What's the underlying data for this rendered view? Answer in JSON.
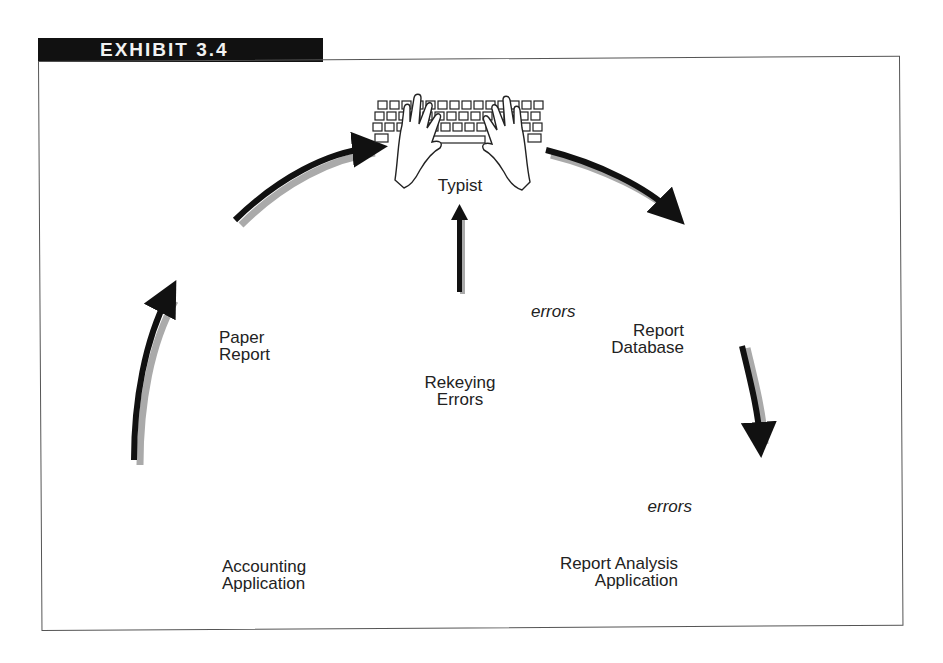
{
  "exhibit": {
    "title": "EXHIBIT 3.4"
  },
  "nodes": {
    "typist": {
      "label": "Typist",
      "icon": "hands-on-keyboard"
    },
    "paper_report": {
      "label_line1": "Paper",
      "label_line2": "Report",
      "icon": "document"
    },
    "report_database": {
      "label_line1": "Report",
      "label_line2": "Database",
      "icon": "server-with-database"
    },
    "rekeying_errors": {
      "label_line1": "Rekeying",
      "label_line2": "Errors",
      "annotation": "errors",
      "icon": "keyboard-crossed-out"
    },
    "accounting_application": {
      "label_line1": "Accounting",
      "label_line2": "Application",
      "icon": "server-with-database"
    },
    "report_analysis_application": {
      "label_line1": "Report Analysis",
      "label_line2": "Application",
      "annotation": "errors",
      "icon": "desktop-computer-with-errors"
    }
  },
  "flow": [
    {
      "from": "Accounting Application",
      "to": "Paper Report"
    },
    {
      "from": "Paper Report",
      "to": "Typist"
    },
    {
      "from": "Rekeying Errors",
      "to": "Typist"
    },
    {
      "from": "Typist",
      "to": "Report Database"
    },
    {
      "from": "Report Database",
      "to": "Report Analysis Application"
    }
  ],
  "colors": {
    "ink": "#111111",
    "shadow": "#9a9a9a",
    "fill": "#cfcfcf",
    "paper": "#ffffff"
  }
}
